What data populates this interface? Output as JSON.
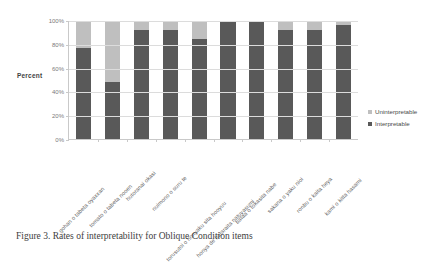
{
  "figure": {
    "caption": "Figure 3. Rates of interpretability for Oblique Condition items"
  },
  "axis": {
    "ylabel": "Percent",
    "yticks": [
      "100%",
      "80%",
      "60%",
      "40%",
      "20%",
      "0%"
    ]
  },
  "legend": {
    "position": "right",
    "items": [
      {
        "label": "Uninterpretable",
        "color": "#bfbfbf"
      },
      {
        "label": "Interpretable",
        "color": "#595959"
      }
    ]
  },
  "colors": {
    "interpretable": "#595959",
    "uninterpretable": "#bfbfbf",
    "gridline": "#dcdcdc",
    "axis": "#c9c9c9",
    "text": "#5c5c5c"
  },
  "chart_data": {
    "type": "bar",
    "subtype": "stacked-percent",
    "title": "",
    "xlabel": "",
    "ylabel": "Percent",
    "ylim": [
      0,
      100
    ],
    "yticks": [
      0,
      20,
      40,
      60,
      80,
      100
    ],
    "grid": true,
    "legend_position": "right",
    "categories": [
      "gohan o tabeta oyaxxan",
      "tomato o tabeta nooen",
      "hutoranai okasi",
      "nuimono o suru te",
      "torusutoi o honyaku sita hooyuu",
      "honya de hataraita natuyasumi",
      "bataa o tokasita nabe",
      "sakana o yaku nioi",
      "ronbu o kaita heya",
      "kami o kitta hasami"
    ],
    "series": [
      {
        "name": "Interpretable",
        "color": "#595959",
        "values": [
          77,
          48,
          92,
          92,
          85,
          100,
          100,
          92,
          92,
          97
        ]
      },
      {
        "name": "Uninterpretable",
        "color": "#bfbfbf",
        "values": [
          23,
          52,
          8,
          8,
          15,
          0,
          0,
          8,
          8,
          3
        ]
      }
    ]
  }
}
